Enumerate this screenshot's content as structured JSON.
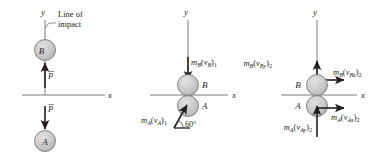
{
  "figure": {
    "panels": [
      {
        "name": "before-impact-setup",
        "axis_y_label": "y",
        "axis_x_label": "x",
        "annotation": {
          "line1": "Line of",
          "line2": "impact"
        },
        "balls": [
          {
            "id": "ball-b",
            "label": "B"
          },
          {
            "id": "ball-a",
            "label": "A"
          }
        ],
        "impulse_labels": [
          {
            "id": "impulse-b",
            "symbol": "P"
          },
          {
            "id": "impulse-a",
            "symbol": "P"
          }
        ]
      },
      {
        "name": "initial-momentum",
        "axis_y_label": "y",
        "axis_x_label": "x",
        "balls": [
          {
            "id": "ball-b",
            "label": "B"
          },
          {
            "id": "ball-a",
            "label": "A"
          }
        ],
        "vectors": [
          {
            "id": "momentum-b-1",
            "mass": "m",
            "mass_sub": "B",
            "open_paren": "(",
            "vel": "v",
            "vel_sub": "B",
            "close_paren": ")",
            "time_sub": "1"
          },
          {
            "id": "momentum-a-1",
            "mass": "m",
            "mass_sub": "A",
            "open_paren": "(",
            "vel": "v",
            "vel_sub": "A",
            "close_paren": ")",
            "time_sub": "1"
          }
        ],
        "angle": "60°"
      },
      {
        "name": "final-momentum-components",
        "axis_y_label": "y",
        "axis_x_label": "x",
        "balls": [
          {
            "id": "ball-b",
            "label": "B"
          },
          {
            "id": "ball-a",
            "label": "A"
          }
        ],
        "vectors": [
          {
            "id": "momentum-by-2",
            "mass": "m",
            "mass_sub": "B",
            "open_paren": "(",
            "vel": "v",
            "vel_sub": "By",
            "close_paren": ")",
            "time_sub": "2"
          },
          {
            "id": "momentum-bx-2",
            "mass": "m",
            "mass_sub": "B",
            "open_paren": "(",
            "vel": "v",
            "vel_sub": "Bx",
            "close_paren": ")",
            "time_sub": "2"
          },
          {
            "id": "momentum-ax-2",
            "mass": "m",
            "mass_sub": "A",
            "open_paren": "(",
            "vel": "v",
            "vel_sub": "Ax",
            "close_paren": ")",
            "time_sub": "2"
          },
          {
            "id": "momentum-ay-2",
            "mass": "m",
            "mass_sub": "A",
            "open_paren": "(",
            "vel": "v",
            "vel_sub": "Ay",
            "close_paren": ")",
            "time_sub": "2"
          }
        ]
      }
    ],
    "colors": {
      "ball_fill": "#c9c9c9",
      "ball_stroke": "#6d6e71",
      "ink": "#231f20",
      "axis": "#58595b",
      "background": "#ffffff"
    }
  }
}
